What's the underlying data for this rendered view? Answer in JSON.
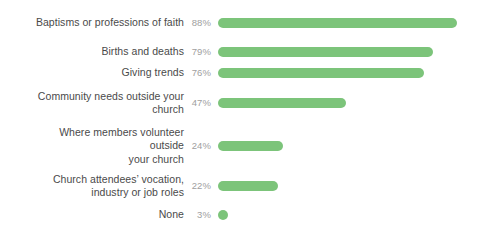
{
  "chart_data": {
    "type": "bar",
    "orientation": "horizontal",
    "title": "",
    "subtitle": "",
    "xlabel": "",
    "ylabel": "",
    "xlim": [
      0,
      100
    ],
    "grid": false,
    "legend": null,
    "value_suffix": "%",
    "bar_color": "#7cc47a",
    "label_color": "#4a4a4a",
    "value_color": "#a0a0a0",
    "background": "#ffffff",
    "categories": [
      "Baptisms or professions of faith",
      "Births and deaths",
      "Giving trends",
      "Community needs outside your church",
      "Where members volunteer outside your church",
      "Church attendees’ vocation, industry or job roles",
      "None"
    ],
    "values": [
      88,
      79,
      76,
      47,
      24,
      22,
      3
    ],
    "bars": [
      {
        "label": "Baptisms or professions of faith",
        "label_lines": "Baptisms or professions of faith",
        "value": 88,
        "value_label": "88%"
      },
      {
        "label": "Births and deaths",
        "label_lines": "Births and deaths",
        "value": 79,
        "value_label": "79%"
      },
      {
        "label": "Giving trends",
        "label_lines": "Giving trends",
        "value": 76,
        "value_label": "76%"
      },
      {
        "label": "Community needs outside your church",
        "label_lines": "Community needs outside your\nchurch",
        "value": 47,
        "value_label": "47%"
      },
      {
        "label": "Where members volunteer outside your church",
        "label_lines": "Where members volunteer outside\nyour church",
        "value": 24,
        "value_label": "24%"
      },
      {
        "label": "Church attendees’ vocation, industry or job roles",
        "label_lines": "Church attendees’ vocation,\nindustry or job roles",
        "value": 22,
        "value_label": "22%"
      },
      {
        "label": "None",
        "label_lines": "None",
        "value": 3,
        "value_label": "3%"
      }
    ]
  }
}
